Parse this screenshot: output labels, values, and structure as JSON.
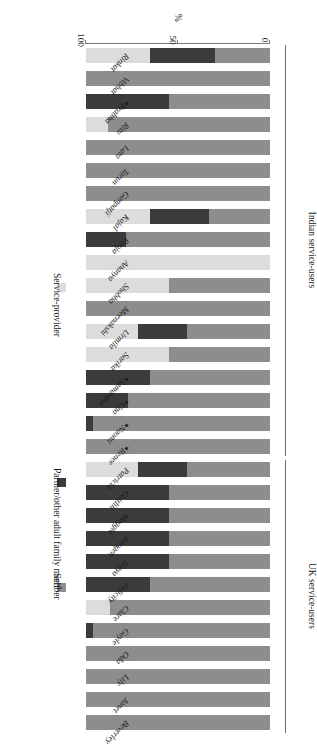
{
  "chart_data": {
    "type": "bar",
    "orientation": "horizontal-stacked",
    "rotated_180": true,
    "title": "",
    "xlabel": "%",
    "ylabel": "",
    "xlim": [
      0,
      100
    ],
    "xticks": [
      0,
      50,
      100
    ],
    "xticklabels": [
      "0",
      "50",
      "100"
    ],
    "grid": false,
    "stacked_total": 100,
    "legend_position": "left",
    "legend": [
      "Self",
      "Partner/other adult family member",
      "Service-provider"
    ],
    "series": [
      {
        "name": "Self",
        "color": "#8d8d8d"
      },
      {
        "name": "Partner/other adult family member",
        "color": "#3b3b3b"
      },
      {
        "name": "Service-provider",
        "color": "#dcdcdc"
      }
    ],
    "groups": [
      {
        "label": "UK service-users",
        "from": "Beverley",
        "to": "Patricia"
      },
      {
        "label": "Indian service-users",
        "from": "Renee",
        "to": "Rinkat"
      }
    ],
    "categories": [
      "Beverley",
      "Janet",
      "Lily",
      "Oda",
      "Gayle",
      "Clare",
      "Felicity",
      "Tanya",
      "Imogen",
      "Maggie",
      "Caitlin",
      "Patricia",
      "Renee",
      "Naomi",
      "Una",
      "Samantha",
      "Sarika",
      "Urmila",
      "Meenakshi",
      "Shobha",
      "Ananya",
      "Pooja",
      "Kajal",
      "Ganpatji",
      "Tarun",
      "Lata",
      "Ritu",
      "Prabha",
      "Vibhat",
      "Rinkat"
    ],
    "starred": [
      "Renee",
      "Naomi",
      "Una",
      "Samantha",
      "Prabha"
    ],
    "rows": [
      {
        "label": "Beverley",
        "group": "UK",
        "star": false,
        "self": 100,
        "partner": 0,
        "provider": 0
      },
      {
        "label": "Janet",
        "group": "UK",
        "star": false,
        "self": 100,
        "partner": 0,
        "provider": 0
      },
      {
        "label": "Lily",
        "group": "UK",
        "star": false,
        "self": 100,
        "partner": 0,
        "provider": 0
      },
      {
        "label": "Oda",
        "group": "UK",
        "star": false,
        "self": 100,
        "partner": 0,
        "provider": 0
      },
      {
        "label": "Gayle",
        "group": "UK",
        "star": false,
        "self": 96,
        "partner": 4,
        "provider": 0
      },
      {
        "label": "Clare",
        "group": "UK",
        "star": false,
        "self": 87,
        "partner": 0,
        "provider": 13
      },
      {
        "label": "Felicity",
        "group": "UK",
        "star": false,
        "self": 65,
        "partner": 35,
        "provider": 0
      },
      {
        "label": "Tanya",
        "group": "UK",
        "star": false,
        "self": 55,
        "partner": 45,
        "provider": 0
      },
      {
        "label": "Imogen",
        "group": "UK",
        "star": false,
        "self": 55,
        "partner": 45,
        "provider": 0
      },
      {
        "label": "Maggie",
        "group": "UK",
        "star": false,
        "self": 55,
        "partner": 45,
        "provider": 0
      },
      {
        "label": "Caitlin",
        "group": "UK",
        "star": false,
        "self": 55,
        "partner": 45,
        "provider": 0
      },
      {
        "label": "Patricia",
        "group": "UK",
        "star": false,
        "self": 45,
        "partner": 27,
        "provider": 28
      },
      {
        "label": "Renee",
        "group": "Indian",
        "star": true,
        "self": 100,
        "partner": 0,
        "provider": 0
      },
      {
        "label": "Naomi",
        "group": "Indian",
        "star": true,
        "self": 96,
        "partner": 4,
        "provider": 0
      },
      {
        "label": "Una",
        "group": "Indian",
        "star": true,
        "self": 77,
        "partner": 23,
        "provider": 0
      },
      {
        "label": "Samantha",
        "group": "Indian",
        "star": true,
        "self": 65,
        "partner": 35,
        "provider": 0
      },
      {
        "label": "Sarika",
        "group": "Indian",
        "star": false,
        "self": 55,
        "partner": 0,
        "provider": 45
      },
      {
        "label": "Urmila",
        "group": "Indian",
        "star": false,
        "self": 45,
        "partner": 27,
        "provider": 28
      },
      {
        "label": "Meenakshi",
        "group": "Indian",
        "star": false,
        "self": 100,
        "partner": 0,
        "provider": 0
      },
      {
        "label": "Shobha",
        "group": "Indian",
        "star": false,
        "self": 55,
        "partner": 0,
        "provider": 45
      },
      {
        "label": "Ananya",
        "group": "Indian",
        "star": false,
        "self": 0,
        "partner": 0,
        "provider": 100
      },
      {
        "label": "Pooja",
        "group": "Indian",
        "star": false,
        "self": 78,
        "partner": 22,
        "provider": 0
      },
      {
        "label": "Kajal",
        "group": "Indian",
        "star": false,
        "self": 33,
        "partner": 32,
        "provider": 35
      },
      {
        "label": "Ganpatji",
        "group": "Indian",
        "star": false,
        "self": 100,
        "partner": 0,
        "provider": 0
      },
      {
        "label": "Tarun",
        "group": "Indian",
        "star": false,
        "self": 100,
        "partner": 0,
        "provider": 0
      },
      {
        "label": "Lata",
        "group": "Indian",
        "star": false,
        "self": 100,
        "partner": 0,
        "provider": 0
      },
      {
        "label": "Ritu",
        "group": "Indian",
        "star": false,
        "self": 88,
        "partner": 0,
        "provider": 12
      },
      {
        "label": "Prabha",
        "group": "Indian",
        "star": true,
        "self": 55,
        "partner": 45,
        "provider": 0
      },
      {
        "label": "Vibhat",
        "group": "Indian",
        "star": false,
        "self": 100,
        "partner": 0,
        "provider": 0
      },
      {
        "label": "Rinkat",
        "group": "Indian",
        "star": false,
        "self": 30,
        "partner": 35,
        "provider": 35
      }
    ]
  },
  "legend": {
    "items": [
      {
        "label": "Self",
        "color": "#8d8d8d"
      },
      {
        "label": "Partner/other adult family member",
        "color": "#3b3b3b"
      },
      {
        "label": "Service-provider",
        "color": "#dcdcdc"
      }
    ]
  },
  "axis": {
    "title": "%",
    "ticks": [
      "0",
      "50",
      "100"
    ]
  },
  "group_labels": {
    "uk": "UK service-users",
    "indian": "Indian service-users"
  }
}
